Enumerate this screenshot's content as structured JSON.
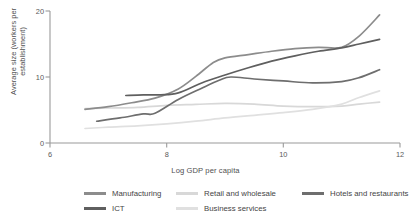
{
  "chart_data": {
    "type": "line",
    "title": "",
    "xlabel": "Log GDP per capita",
    "ylabel": "Average size (workers per establishment)",
    "xlim": [
      6,
      12
    ],
    "ylim": [
      0,
      20
    ],
    "xticks": [
      "6",
      "8",
      "10",
      "12"
    ],
    "yticks": [
      "0",
      "10",
      "20"
    ],
    "grid": false,
    "legend_position": "bottom",
    "series": [
      {
        "name": "Manufacturing",
        "color": "#8c8c8c",
        "x": [
          6.6,
          7.0,
          7.4,
          7.8,
          8.2,
          8.5,
          8.8,
          9.0,
          9.4,
          9.8,
          10.2,
          10.6,
          11.0,
          11.3,
          11.65
        ],
        "values": [
          5.1,
          5.5,
          6.1,
          6.8,
          8.2,
          10.1,
          12.2,
          12.9,
          13.4,
          13.9,
          14.3,
          14.5,
          14.5,
          16.2,
          19.4
        ]
      },
      {
        "name": "Retail and wholesale",
        "color": "#d8d8d8",
        "x": [
          6.6,
          7.0,
          7.5,
          8.0,
          8.5,
          9.0,
          9.5,
          10.0,
          10.5,
          11.0,
          11.3,
          11.65
        ],
        "values": [
          5.2,
          5.3,
          5.4,
          5.7,
          5.85,
          6.0,
          5.9,
          5.6,
          5.5,
          5.6,
          5.9,
          6.2
        ]
      },
      {
        "name": "Hotels and restaurants",
        "color": "#6e6e6e",
        "x": [
          6.8,
          7.2,
          7.6,
          7.8,
          8.2,
          8.6,
          8.9,
          9.1,
          9.5,
          10.0,
          10.5,
          11.0,
          11.3,
          11.65
        ],
        "values": [
          3.3,
          3.8,
          4.4,
          4.5,
          6.6,
          8.3,
          9.5,
          10.0,
          9.7,
          9.4,
          9.1,
          9.3,
          9.9,
          11.1
        ]
      },
      {
        "name": "ICT",
        "color": "#5f5f5f",
        "x": [
          7.3,
          7.6,
          7.9,
          8.2,
          8.6,
          9.0,
          9.4,
          9.8,
          10.2,
          10.6,
          11.0,
          11.3,
          11.65
        ],
        "values": [
          7.2,
          7.3,
          7.3,
          7.6,
          9.1,
          10.3,
          11.4,
          12.4,
          13.2,
          13.9,
          14.4,
          15.0,
          15.7
        ]
      },
      {
        "name": "Business services",
        "color": "#e0e0e0",
        "x": [
          6.6,
          7.0,
          7.5,
          8.0,
          8.5,
          9.0,
          9.5,
          10.0,
          10.5,
          11.0,
          11.3,
          11.65
        ],
        "values": [
          2.2,
          2.4,
          2.6,
          2.9,
          3.3,
          3.8,
          4.2,
          4.6,
          5.1,
          5.9,
          6.9,
          7.9
        ]
      }
    ]
  },
  "axes": {
    "y_tick_0": "0",
    "y_tick_1": "10",
    "y_tick_2": "20",
    "x_tick_0": "6",
    "x_tick_1": "8",
    "x_tick_2": "10",
    "x_tick_3": "12",
    "ylabel": "Average size (workers per establishment)",
    "xlabel": "Log GDP per capita"
  },
  "legend": {
    "items": [
      {
        "label": "Manufacturing",
        "color": "#8c8c8c"
      },
      {
        "label": "Retail and wholesale",
        "color": "#d8d8d8"
      },
      {
        "label": "Hotels and restaurants",
        "color": "#6e6e6e"
      },
      {
        "label": "ICT",
        "color": "#5f5f5f"
      },
      {
        "label": "Business services",
        "color": "#e0e0e0"
      }
    ]
  },
  "style": {
    "axis_color": "#9a9a9a",
    "text_color": "#4a4a4a",
    "background": "#ffffff"
  }
}
